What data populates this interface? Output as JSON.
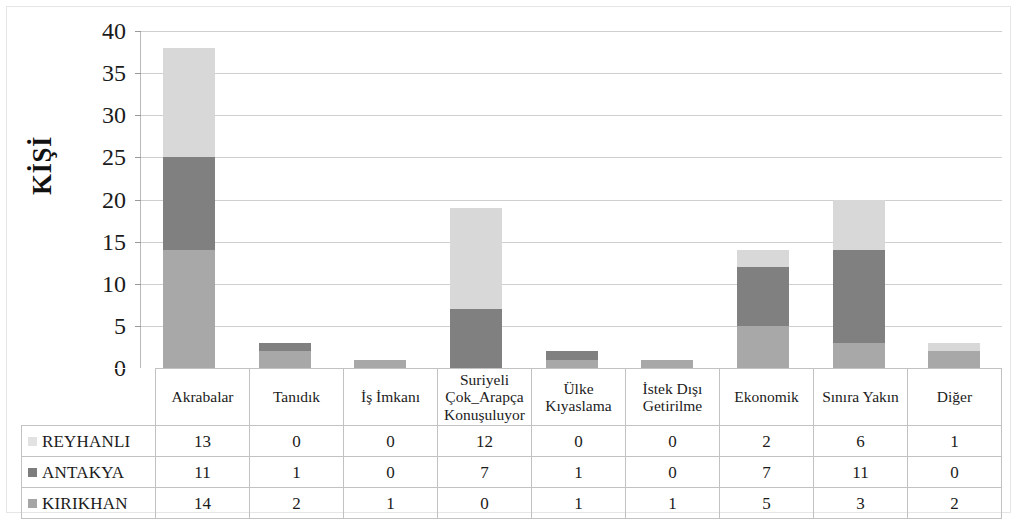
{
  "chart_data": {
    "type": "bar",
    "stacked": true,
    "title": "",
    "xlabel": "",
    "ylabel": "KİŞİ",
    "ylim": [
      0,
      40
    ],
    "ytick_step": 5,
    "yticks": [
      0,
      5,
      10,
      15,
      20,
      25,
      30,
      35,
      40
    ],
    "grid": true,
    "legend_position": "data-table-left",
    "categories": [
      "Akrabalar",
      "Tanıdık",
      "İş İmkanı",
      "Suriyeli Çok_Arapça Konuşuluyor",
      "Ülke Kıyaslama",
      "İstek Dışı Getirilme",
      "Ekonomik",
      "Sınıra Yakın",
      "Diğer"
    ],
    "category_lines": [
      [
        "Akrabalar"
      ],
      [
        "Tanıdık"
      ],
      [
        "İş İmkanı"
      ],
      [
        "Suriyeli",
        "Çok_Arapça",
        "Konuşuluyor"
      ],
      [
        "Ülke",
        "Kıyaslama"
      ],
      [
        "İstek Dışı",
        "Getirilme"
      ],
      [
        "Ekonomik"
      ],
      [
        "Sınıra Yakın"
      ],
      [
        "Diğer"
      ]
    ],
    "series": [
      {
        "name": "REYHANLI",
        "color": "#d8d8d8",
        "stack_order": 3,
        "values": [
          13,
          0,
          0,
          12,
          0,
          0,
          2,
          6,
          1
        ]
      },
      {
        "name": "ANTAKYA",
        "color": "#808080",
        "stack_order": 2,
        "values": [
          11,
          1,
          0,
          7,
          1,
          0,
          7,
          11,
          0
        ]
      },
      {
        "name": "KIRIKHAN",
        "color": "#a8a8a8",
        "stack_order": 1,
        "values": [
          14,
          2,
          1,
          0,
          1,
          1,
          5,
          3,
          2
        ]
      }
    ],
    "totals": [
      38,
      3,
      1,
      19,
      2,
      1,
      14,
      20,
      3
    ]
  },
  "axis": {
    "y_title": "KİŞİ",
    "y_labels": [
      "40",
      "35",
      "30",
      "25",
      "20",
      "15",
      "10",
      "5",
      "0"
    ]
  },
  "table": {
    "legend_marker": "square-swatch-icon",
    "rows": [
      {
        "name": "REYHANLI",
        "color": "#e2e2e2",
        "cells": [
          "13",
          "0",
          "0",
          "12",
          "0",
          "0",
          "2",
          "6",
          "1"
        ]
      },
      {
        "name": "ANTAKYA",
        "color": "#7d7d7d",
        "cells": [
          "11",
          "1",
          "0",
          "7",
          "1",
          "0",
          "7",
          "11",
          "0"
        ]
      },
      {
        "name": "KIRIKHAN",
        "color": "#a5a5a5",
        "cells": [
          "14",
          "2",
          "1",
          "0",
          "1",
          "1",
          "5",
          "3",
          "2"
        ]
      }
    ]
  }
}
